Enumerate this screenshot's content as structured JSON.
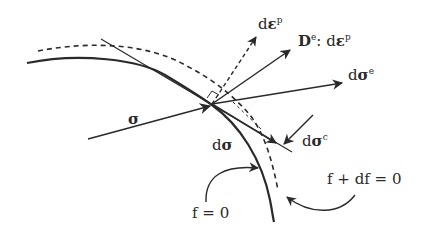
{
  "diagram": {
    "type": "plasticity-yield-surface",
    "colors": {
      "ink": "#2a2a2a",
      "background": "#ffffff"
    },
    "labels": {
      "sigma": "σ",
      "d_sigma": "dσ",
      "d_eps_p_d": "d",
      "d_eps_p_eps": "ε",
      "d_eps_p_sup": "p",
      "De_D": "D",
      "De_sup": "e",
      "De_colon": ": d",
      "De_eps": "ε",
      "De_eps_sup": "p",
      "d_sigma_e_d": "d",
      "d_sigma_e_sigma": "σ",
      "d_sigma_e_sup": "e",
      "d_sigma_c_d": "d",
      "d_sigma_c_sigma": "σ",
      "d_sigma_c_sup": "c",
      "f_zero": "f = 0",
      "f_df_zero": "f + df = 0"
    },
    "elements": [
      {
        "name": "yield-surface",
        "style": "solid",
        "label": "f = 0"
      },
      {
        "name": "updated-yield-surface",
        "style": "dashed",
        "label": "f + df = 0"
      },
      {
        "name": "tangent-line",
        "style": "thin"
      },
      {
        "name": "stress-vector",
        "label": "σ"
      },
      {
        "name": "plastic-strain-increment",
        "style": "dashed",
        "label": "dε^p"
      },
      {
        "name": "elastic-plastic-corrector",
        "label": "D^e : dε^p"
      },
      {
        "name": "elastic-trial-increment",
        "label": "dσ^e"
      },
      {
        "name": "stress-increment",
        "label": "dσ"
      },
      {
        "name": "corrector-increment",
        "label": "dσ^c"
      }
    ]
  }
}
